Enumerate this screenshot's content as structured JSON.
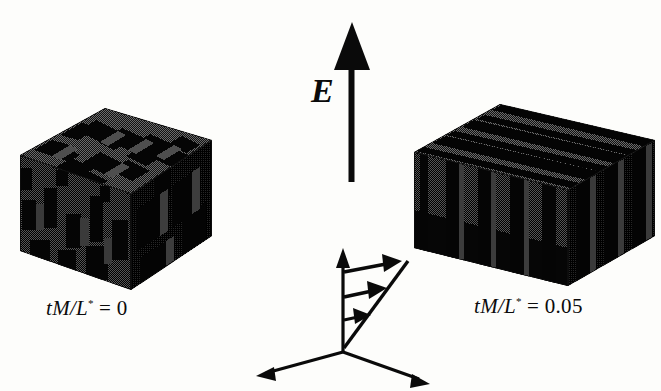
{
  "figure": {
    "kind": "scientific-figure",
    "background_color": "#fdfdfb",
    "ink_color": "#0b0b0b",
    "width": 661,
    "height": 391
  },
  "field": {
    "symbol": "E",
    "arrow_name": "electric-field-arrow",
    "direction": "up",
    "tip_y": 24,
    "base_y": 182,
    "x": 352
  },
  "panels": [
    {
      "id": "left",
      "label_prefix": "tM/L",
      "label_superscript": "*",
      "label_equals": " = ",
      "label_value": "0",
      "label_full": "tM/L* = 0",
      "morphology": "disordered-bicontinuous",
      "cube_left": 20,
      "cube_top": 108,
      "cube_width": 192,
      "cube_height": 182
    },
    {
      "id": "right",
      "label_prefix": "tM/L",
      "label_superscript": "*",
      "label_equals": " = ",
      "label_value": "0.05",
      "label_full": "tM/L* = 0.05",
      "morphology": "aligned-lamellar",
      "cube_left": 414,
      "cube_top": 104,
      "cube_width": 241,
      "cube_height": 182
    }
  ],
  "axes": {
    "name": "coordinate-triad",
    "origin_x": 343,
    "origin_y": 352,
    "vertical_tip_y": 252,
    "left_tip_x": 258,
    "left_tip_y": 376,
    "right_tip_x": 428,
    "right_tip_y": 384,
    "shear_profile": {
      "name": "shear-velocity-profile",
      "arrow_count": 3,
      "arrow_lengths": [
        26,
        46,
        62
      ],
      "arrow_ys": [
        320,
        295,
        268
      ],
      "hypotenuse_from": [
        343,
        345
      ],
      "hypotenuse_to": [
        408,
        262
      ]
    }
  }
}
